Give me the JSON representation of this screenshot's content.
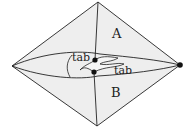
{
  "diagram": {
    "labels": {
      "region_a": "A",
      "region_b": "B",
      "tab_left": "tab",
      "tab_right": "tab"
    },
    "colors": {
      "fill": "#eeeeee",
      "stroke": "#222222",
      "dot": "#111111"
    }
  }
}
